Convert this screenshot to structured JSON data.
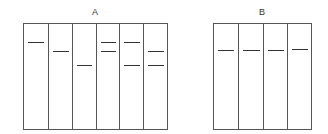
{
  "gels": [
    {
      "label": "A",
      "box": {
        "left": 23,
        "top": 23,
        "width": 145,
        "height": 107
      },
      "lane_count": 6,
      "lanes": [
        {
          "bands": [
            42
          ]
        },
        {
          "bands": [
            51
          ]
        },
        {
          "bands": [
            65
          ]
        },
        {
          "bands": [
            42,
            51
          ]
        },
        {
          "bands": [
            42,
            65
          ]
        },
        {
          "bands": [
            51,
            65
          ]
        }
      ]
    },
    {
      "label": "B",
      "box": {
        "left": 213,
        "top": 23,
        "width": 99,
        "height": 107
      },
      "lane_count": 4,
      "lanes": [
        {
          "bands": [
            50
          ]
        },
        {
          "bands": [
            50
          ]
        },
        {
          "bands": [
            50
          ]
        },
        {
          "bands": [
            49
          ]
        }
      ]
    }
  ],
  "colors": {
    "line": "#555555",
    "band": "#333333",
    "background": "#ffffff"
  }
}
